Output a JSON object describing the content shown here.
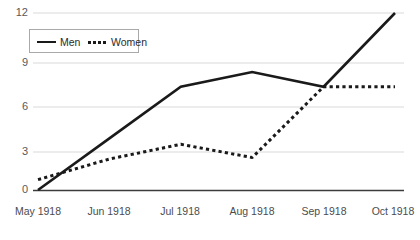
{
  "chart_data": {
    "type": "line",
    "title": "",
    "subtitle": "",
    "xlabel": "",
    "ylabel": "",
    "categories": [
      "May 1918",
      "Jun 1918",
      "Jul 1918",
      "Aug 1918",
      "Sep 1918",
      "Oct 1918"
    ],
    "yticks": [
      0,
      3,
      6,
      9,
      12
    ],
    "ytick_labels": [
      "0",
      "3",
      "6",
      "9",
      "12"
    ],
    "ylim": [
      0,
      12
    ],
    "grid": true,
    "legend_position": "top-left",
    "series": [
      {
        "name": "Men",
        "style": "solid",
        "color": "#1a1a1a",
        "values": [
          0,
          3.5,
          7,
          8,
          7,
          12
        ]
      },
      {
        "name": "Women",
        "style": "dotted",
        "color": "#1a1a1a",
        "values": [
          0.7,
          2.1,
          3.1,
          2.2,
          7,
          7
        ]
      }
    ]
  },
  "legend": {
    "entries": [
      {
        "label": "Men",
        "style": "solid"
      },
      {
        "label": "Women",
        "style": "dotted"
      }
    ]
  },
  "colors": {
    "grid": "#d9d9d9",
    "axis": "#3c3c3c",
    "line": "#1a1a1a",
    "tick_text": "#58595b",
    "background": "#ffffff"
  }
}
